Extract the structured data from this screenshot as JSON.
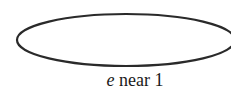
{
  "diagram": {
    "shape": "ellipse",
    "caption": {
      "variable": "e",
      "rest": " near 1"
    },
    "stroke_color": "#2a2a2a"
  }
}
